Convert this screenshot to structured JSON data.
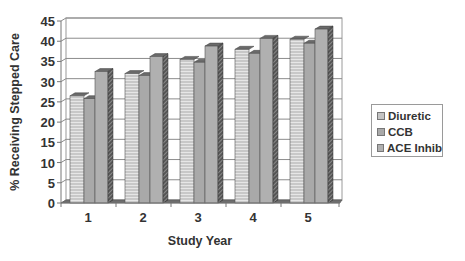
{
  "chart_data": {
    "type": "bar",
    "style": "3d-clustered-column",
    "title": "",
    "xlabel": "Study Year",
    "ylabel": "% Receiving Stepped Care",
    "categories": [
      "1",
      "2",
      "3",
      "4",
      "5"
    ],
    "series": [
      {
        "name": "Diuretic",
        "values": [
          26.5,
          32,
          35.5,
          38,
          40.5
        ],
        "color": "#c4c4c4",
        "pattern": "horizontal-stripes"
      },
      {
        "name": "CCB",
        "values": [
          25.8,
          31.5,
          34.8,
          37,
          39.5
        ],
        "color": "#a9a9a9",
        "pattern": "solid"
      },
      {
        "name": "ACE Inhib",
        "values": [
          32.5,
          36.2,
          38.8,
          40.7,
          43
        ],
        "color": "#b0b0b0",
        "pattern": "solid"
      }
    ],
    "ylim": [
      0,
      45
    ],
    "yticks": [
      0,
      5,
      10,
      15,
      20,
      25,
      30,
      35,
      40,
      45
    ],
    "grid": true,
    "legend_position": "right"
  },
  "legend": {
    "items": [
      {
        "label": "Diuretic",
        "color": "#c4c4c4"
      },
      {
        "label": "CCB",
        "color": "#a9a9a9"
      },
      {
        "label": "ACE Inhib",
        "color": "#b0b0b0"
      }
    ]
  }
}
